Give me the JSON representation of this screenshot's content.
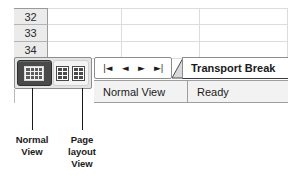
{
  "spreadsheet": {
    "row_headers": [
      "32",
      "33",
      "34"
    ],
    "columns": [
      "",
      "",
      ""
    ],
    "rows": [
      [
        "",
        "",
        ""
      ],
      [
        "",
        "",
        ""
      ],
      [
        "",
        "",
        ""
      ]
    ]
  },
  "view_switcher": {
    "normal_view": {
      "label": "Normal View",
      "icon": "grid-icon",
      "selected": true
    },
    "page_layout_view": {
      "label": "Page layout View",
      "icon": "two-pages-icon",
      "selected": false
    }
  },
  "sheet_navigation": {
    "first_label": "|◄",
    "previous_label": "◄",
    "next_label": "►",
    "last_label": "►|"
  },
  "sheet_tab": {
    "label": "Transport Break"
  },
  "status_bar": {
    "view_mode": "Normal View",
    "state": "Ready"
  },
  "callouts": {
    "normal": [
      "Normal",
      "View"
    ],
    "page_layout": [
      "Page",
      "layout",
      "View"
    ]
  },
  "colors": {
    "selected_button_bg": "#4a4a4a",
    "panel_bg": "#e4e4e4",
    "row_header_bg": "#ebebeb",
    "status_bar_bg": "#f2f2f2",
    "grid_line": "#dcdcdc",
    "text": "#1a1a1a"
  }
}
